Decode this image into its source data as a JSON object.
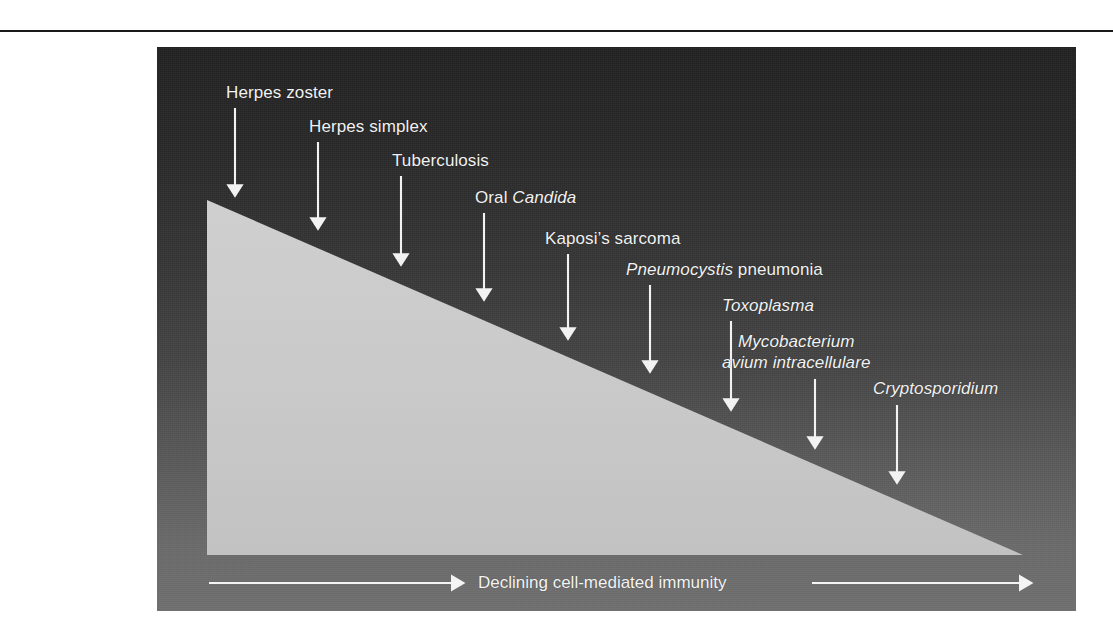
{
  "figure": {
    "panel_background_top": "#202020",
    "panel_background_bottom": "#6d6d6d",
    "triangle_fill": "#c8c8c8",
    "marker_color": "#f2f2f2",
    "rule_color": "#1a1a1a"
  },
  "chart_data": {
    "type": "diagram",
    "title": "",
    "xlabel": "Declining cell-mediated immunity",
    "ylabel": "",
    "axis_arrow_direction": "right",
    "annotations": [
      {
        "index": 0,
        "label_parts": [
          {
            "text": "Herpes zoster",
            "style": "roman"
          }
        ],
        "plain_text": "Herpes zoster",
        "arrow_x": 235,
        "label_x": 226,
        "label_y": 82,
        "arrow_top": 108,
        "arrow_tip_y": 198
      },
      {
        "index": 1,
        "label_parts": [
          {
            "text": "Herpes simplex",
            "style": "roman"
          }
        ],
        "plain_text": "Herpes simplex",
        "arrow_x": 318,
        "label_x": 309,
        "label_y": 116,
        "arrow_top": 142,
        "arrow_tip_y": 231
      },
      {
        "index": 2,
        "label_parts": [
          {
            "text": "Tuberculosis",
            "style": "roman"
          }
        ],
        "plain_text": "Tuberculosis",
        "arrow_x": 401,
        "label_x": 392,
        "label_y": 150,
        "arrow_top": 176,
        "arrow_tip_y": 267
      },
      {
        "index": 3,
        "label_parts": [
          {
            "text": "Oral ",
            "style": "roman"
          },
          {
            "text": "Candida",
            "style": "italic"
          }
        ],
        "plain_text": "Oral Candida",
        "arrow_x": 484,
        "label_x": 475,
        "label_y": 187,
        "arrow_top": 213,
        "arrow_tip_y": 302
      },
      {
        "index": 4,
        "label_parts": [
          {
            "text": "Kaposi’s sarcoma",
            "style": "roman"
          }
        ],
        "plain_text": "Kaposi’s sarcoma",
        "arrow_x": 568,
        "label_x": 545,
        "label_y": 228,
        "arrow_top": 254,
        "arrow_tip_y": 341
      },
      {
        "index": 5,
        "label_parts": [
          {
            "text": "Pneumocystis",
            "style": "italic"
          },
          {
            "text": " pneumonia",
            "style": "roman"
          }
        ],
        "plain_text": "Pneumocystis pneumonia",
        "arrow_x": 650,
        "label_x": 626,
        "label_y": 259,
        "arrow_top": 285,
        "arrow_tip_y": 374
      },
      {
        "index": 6,
        "label_parts": [
          {
            "text": "Toxoplasma",
            "style": "italic"
          }
        ],
        "plain_text": "Toxoplasma",
        "arrow_x": 731,
        "label_x": 722,
        "label_y": 295,
        "arrow_top": 321,
        "arrow_tip_y": 412
      },
      {
        "index": 7,
        "label_parts": [
          {
            "text": "Mycobacterium",
            "style": "italic"
          },
          {
            "text": "avium intracellulare",
            "style": "italic"
          }
        ],
        "plain_text": "Mycobacterium avium intracellulare",
        "line1": "Mycobacterium",
        "line2": "avium intracellulare",
        "arrow_x": 815,
        "label_x": 722,
        "label_y": 331,
        "arrow_top": 379,
        "arrow_tip_y": 450
      },
      {
        "index": 8,
        "label_parts": [
          {
            "text": "Cryptosporidium",
            "style": "italic"
          }
        ],
        "plain_text": "Cryptosporidium",
        "arrow_x": 897,
        "label_x": 873,
        "label_y": 378,
        "arrow_top": 405,
        "arrow_tip_y": 485
      }
    ],
    "axis": {
      "text": "Declining cell-mediated immunity",
      "left_arrow": {
        "x1": 209,
        "x2": 465,
        "y": 583
      },
      "right_arrow": {
        "x1": 812,
        "x2": 1033,
        "y": 583
      },
      "text_x": 478,
      "text_y": 573
    },
    "triangle": {
      "apex_left_top": [
        207,
        200
      ],
      "corner_bottom_left": [
        207,
        555
      ],
      "corner_bottom_right": [
        1023,
        555
      ]
    }
  }
}
